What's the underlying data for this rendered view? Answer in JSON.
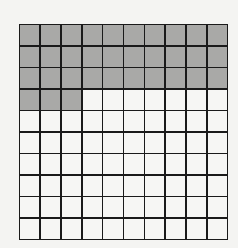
{
  "grid": {
    "rows": 10,
    "columns": 10,
    "total_cells": 100,
    "shaded_cells": 33,
    "shaded_color": "#a9a9a7",
    "unshaded_color": "#f6f6f4",
    "line_color": "#1a1a1a",
    "shaded_fill_order": "row-major from top-left"
  }
}
